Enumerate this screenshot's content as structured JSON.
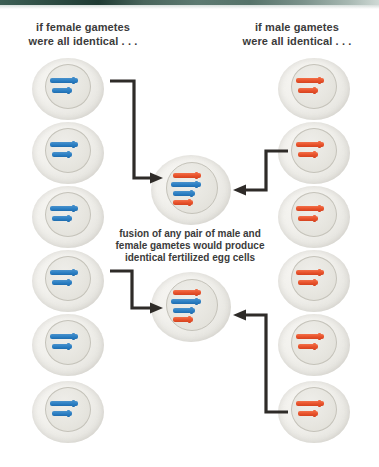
{
  "figure": {
    "heading_female": "if female gametes\nwere all identical . . .",
    "heading_male": "if male gametes\nwere all identical . . .",
    "caption": "fusion of any pair of male and\nfemale gametes would produce\nidentical fertilized egg cells"
  },
  "colors": {
    "female_chromosome": "#2b7fc4",
    "male_chromosome": "#e8512a",
    "arrow": "#2e2b28",
    "text": "#3b3b3b",
    "cell_fill": "#f2f1ed",
    "nucleus_fill": "#e7e6e0",
    "top_band": "#2f4e45"
  },
  "female_gametes": [
    {
      "label": "female-gamete-1",
      "chromosomes": [
        "blue",
        "blue"
      ]
    },
    {
      "label": "female-gamete-2",
      "chromosomes": [
        "blue",
        "blue"
      ]
    },
    {
      "label": "female-gamete-3",
      "chromosomes": [
        "blue",
        "blue"
      ]
    },
    {
      "label": "female-gamete-4",
      "chromosomes": [
        "blue",
        "blue"
      ]
    },
    {
      "label": "female-gamete-5",
      "chromosomes": [
        "blue",
        "blue"
      ]
    },
    {
      "label": "female-gamete-6",
      "chromosomes": [
        "blue",
        "blue"
      ]
    }
  ],
  "male_gametes": [
    {
      "label": "male-gamete-1",
      "chromosomes": [
        "orange",
        "orange"
      ]
    },
    {
      "label": "male-gamete-2",
      "chromosomes": [
        "orange",
        "orange"
      ]
    },
    {
      "label": "male-gamete-3",
      "chromosomes": [
        "orange",
        "orange"
      ]
    },
    {
      "label": "male-gamete-4",
      "chromosomes": [
        "orange",
        "orange"
      ]
    },
    {
      "label": "male-gamete-5",
      "chromosomes": [
        "orange",
        "orange"
      ]
    },
    {
      "label": "male-gamete-6",
      "chromosomes": [
        "orange",
        "orange"
      ]
    }
  ],
  "zygotes": [
    {
      "label": "fertilized-egg-cell-1",
      "chromosomes": [
        "orange",
        "blue",
        "blue",
        "orange"
      ]
    },
    {
      "label": "fertilized-egg-cell-2",
      "chromosomes": [
        "orange",
        "blue",
        "blue",
        "orange"
      ]
    }
  ],
  "arrows": [
    {
      "name": "arrow-female-to-zygote-1",
      "from": "female-gamete-1",
      "to": "fertilized-egg-cell-1"
    },
    {
      "name": "arrow-male-to-zygote-1",
      "from": "male-gamete-2",
      "to": "fertilized-egg-cell-1"
    },
    {
      "name": "arrow-female-to-zygote-2",
      "from": "female-gamete-4",
      "to": "fertilized-egg-cell-2"
    },
    {
      "name": "arrow-male-to-zygote-2",
      "from": "male-gamete-6",
      "to": "fertilized-egg-cell-2"
    }
  ]
}
